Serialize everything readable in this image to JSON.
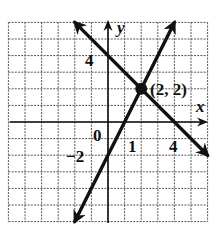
{
  "graph": {
    "grid": {
      "xmin": -6,
      "xmax": 6,
      "ymin": -6,
      "ymax": 6
    },
    "axes": {
      "x_label": "x",
      "y_label": "y"
    },
    "tick_labels": {
      "origin": "0",
      "x_one": "1",
      "x_four": "4",
      "y_four": "4",
      "y_neg_two": "−2"
    },
    "lines": [
      {
        "name": "line-decreasing",
        "equation": "y = -x + 4",
        "from": [
          -2,
          6
        ],
        "to": [
          6,
          -2
        ]
      },
      {
        "name": "line-increasing",
        "equation": "y = 2x - 2",
        "from": [
          -2,
          -6
        ],
        "to": [
          4,
          6
        ]
      }
    ],
    "intersection": {
      "point": [
        2,
        2
      ],
      "label": "(2, 2)"
    },
    "colors": {
      "ink": "#111111",
      "grid": "#555555",
      "background": "#ffffff"
    }
  }
}
